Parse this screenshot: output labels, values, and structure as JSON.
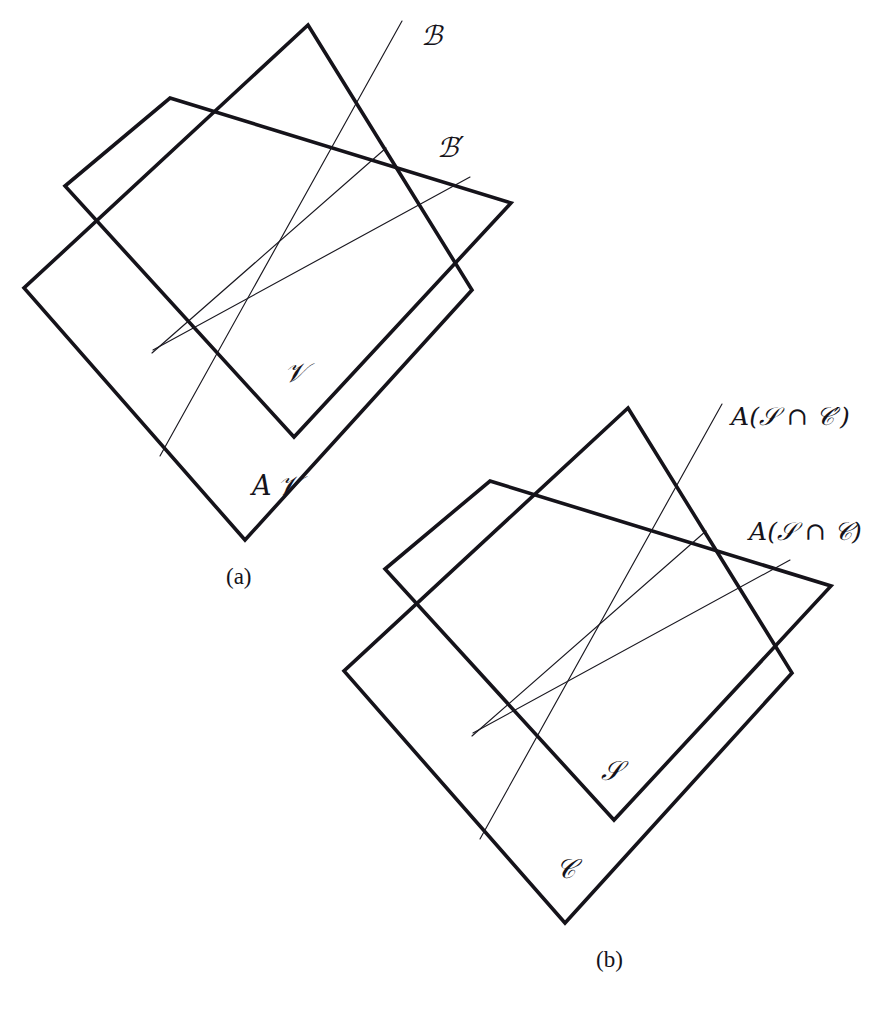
{
  "figure": {
    "background_color": "#ffffff",
    "stroke_color": "#15131a",
    "thin_stroke_color": "#1a1820",
    "width": 870,
    "height": 1011
  },
  "panels": [
    {
      "id": "a",
      "caption": "(a)",
      "labels": {
        "ray_top": "ℬ",
        "ray_right": "ℬ′",
        "inner_plane": "𝒱",
        "outer_plane_prefix": "A",
        "outer_plane": "𝒱",
        "outer_plane_full": "A 𝒱"
      }
    },
    {
      "id": "b",
      "caption": "(b)",
      "labels": {
        "ray_top": "A(𝒮 ∩ 𝒞′)",
        "ray_right": "A(𝒮 ∩ 𝒞)",
        "inner_plane": "𝒮",
        "outer_plane": "𝒞"
      }
    }
  ],
  "label_parts": {
    "a_ray_top": {
      "script": "B"
    },
    "a_ray_right": {
      "script": "B",
      "prime": "′"
    },
    "a_inner": {
      "script": "V"
    },
    "a_outer": {
      "roman": "A",
      "script": "V"
    },
    "b_ray_top": {
      "op": "A",
      "open": "(",
      "s": "S",
      "cap": "∩",
      "c": "C",
      "prime": "′",
      "close": ")"
    },
    "b_ray_right": {
      "op": "A",
      "open": "(",
      "s": "S",
      "cap": "∩",
      "c": "C",
      "close": ")"
    },
    "b_inner": {
      "script": "S"
    },
    "b_outer": {
      "script": "C"
    }
  },
  "geometry": {
    "panel_a": {
      "outer_plane_vertices": [
        [
          308,
          25
        ],
        [
          472,
          290
        ],
        [
          245,
          540
        ],
        [
          24,
          288
        ]
      ],
      "inner_plane_vertices": [
        [
          170,
          98
        ],
        [
          511,
          203
        ],
        [
          294,
          437
        ],
        [
          65,
          186
        ]
      ],
      "center_point": [
        283,
        240
      ],
      "rays": [
        {
          "name": "ray-to-B",
          "from": [
            160,
            456
          ],
          "to": [
            402,
            21
          ]
        },
        {
          "name": "ray-to-B-prime",
          "from": [
            153,
            350
          ],
          "to": [
            470,
            177
          ]
        },
        {
          "name": "ray-diagonal",
          "from": [
            152,
            353
          ],
          "to": [
            386,
            148
          ]
        }
      ]
    },
    "panel_b": {
      "outer_plane_vertices": [
        [
          628,
          408
        ],
        [
          792,
          673
        ],
        [
          565,
          923
        ],
        [
          344,
          671
        ]
      ],
      "inner_plane_vertices": [
        [
          490,
          481
        ],
        [
          831,
          586
        ],
        [
          614,
          820
        ],
        [
          385,
          569
        ]
      ],
      "center_point": [
        603,
        623
      ],
      "rays": [
        {
          "name": "ray-to-ASC-prime",
          "from": [
            480,
            839
          ],
          "to": [
            722,
            404
          ]
        },
        {
          "name": "ray-to-ASC",
          "from": [
            473,
            733
          ],
          "to": [
            790,
            560
          ]
        },
        {
          "name": "ray-diagonal",
          "from": [
            472,
            736
          ],
          "to": [
            706,
            531
          ]
        }
      ]
    }
  },
  "label_positions": {
    "a_ray_top": [
      421,
      22
    ],
    "a_ray_right": [
      437,
      134
    ],
    "a_inner": [
      284,
      359
    ],
    "a_outer": [
      252,
      472
    ],
    "a_caption": [
      226,
      565
    ],
    "b_ray_top": [
      731,
      404
    ],
    "b_ray_right": [
      749,
      519
    ],
    "b_inner": [
      601,
      757
    ],
    "b_outer": [
      556,
      855
    ],
    "b_caption": [
      596,
      948
    ]
  }
}
